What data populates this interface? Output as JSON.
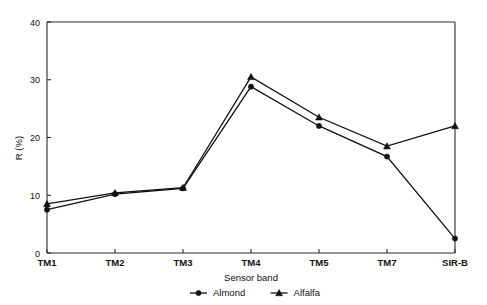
{
  "chart_data": {
    "type": "line",
    "title": "",
    "xlabel": "Sensor band",
    "ylabel": "R (%)",
    "categories": [
      "TM1",
      "TM2",
      "TM3",
      "TM4",
      "TM5",
      "TM7",
      "SIR-B"
    ],
    "ylim": [
      0,
      40
    ],
    "yticks": [
      0,
      10,
      20,
      30,
      40
    ],
    "ytick_labels": [
      "0",
      "10",
      "20",
      "30",
      "40"
    ],
    "grid": false,
    "legend_position": "below-axis-centered",
    "series": [
      {
        "name": "Almond",
        "marker": "filled-circle",
        "color": "#111111",
        "values": [
          7.5,
          10.2,
          11.2,
          28.8,
          22.0,
          16.7,
          2.5
        ]
      },
      {
        "name": "Alfalfa",
        "marker": "filled-triangle",
        "color": "#111111",
        "values": [
          8.5,
          10.4,
          11.3,
          30.5,
          23.5,
          18.5,
          22.0
        ]
      }
    ]
  },
  "axes": {
    "y_axis_label": "R (%)",
    "x_axis_label": "Sensor band"
  },
  "legend": {
    "items": [
      {
        "label": "Almond",
        "marker": "filled-circle"
      },
      {
        "label": "Alfalfa",
        "marker": "filled-triangle"
      }
    ]
  }
}
